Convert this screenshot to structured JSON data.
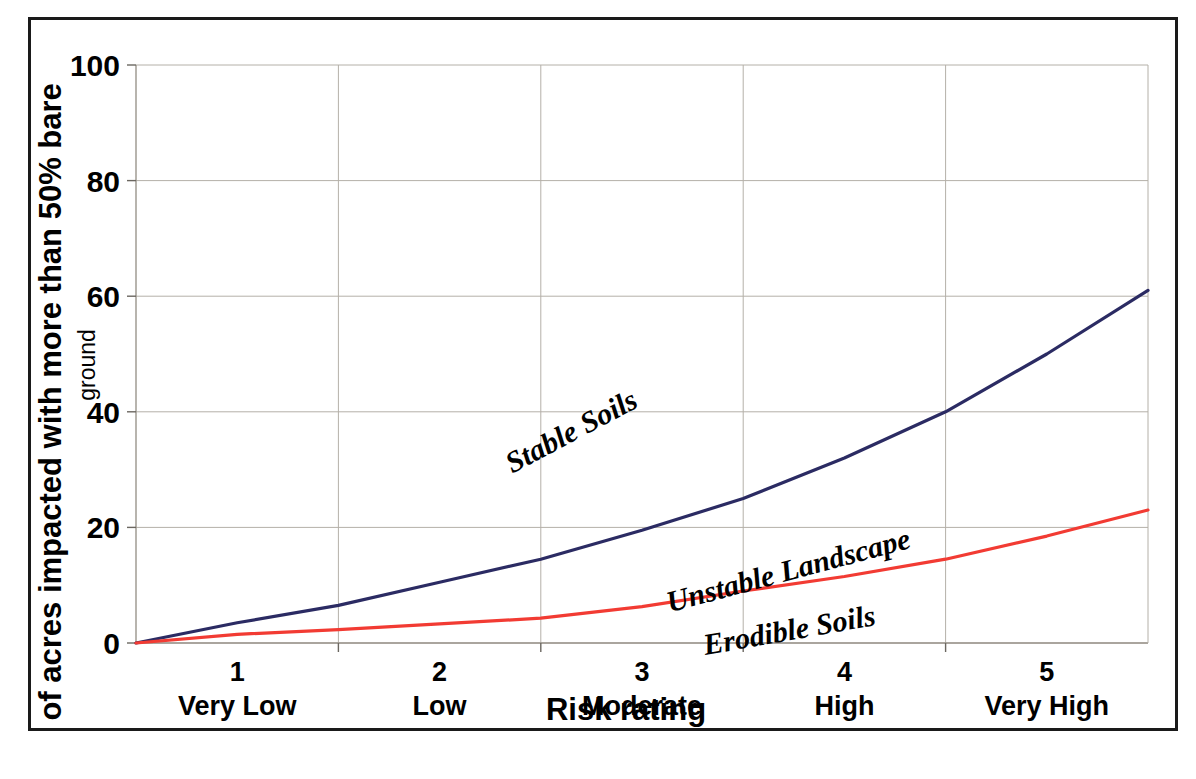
{
  "chart_data": {
    "type": "line",
    "title": "",
    "xlabel": "Risk rating",
    "ylabel": "% of acres impacted with more than 50% bare",
    "ylabel_line2": "ground",
    "ylim": [
      0,
      100
    ],
    "yticks": [
      0,
      20,
      40,
      60,
      80,
      100
    ],
    "ytick_labels": [
      "0",
      "20",
      "40",
      "60",
      "80",
      "100"
    ],
    "xlim": [
      0.5,
      5.5
    ],
    "grid": true,
    "legend_position": "inline-annotations",
    "categories": [
      {
        "num": "1",
        "name": "Very Low",
        "x": 1
      },
      {
        "num": "2",
        "name": "Low",
        "x": 2
      },
      {
        "num": "3",
        "name": "Moderate",
        "x": 3
      },
      {
        "num": "4",
        "name": "High",
        "x": 4
      },
      {
        "num": "5",
        "name": "Very High",
        "x": 5
      }
    ],
    "gridline_x_values": [
      1.5,
      2.5,
      3.5,
      4.5
    ],
    "series": [
      {
        "name": "Stable Soils",
        "color": "#2b2b63",
        "x": [
          0.5,
          1.0,
          1.5,
          2.0,
          2.5,
          3.0,
          3.5,
          4.0,
          4.5,
          5.0,
          5.5
        ],
        "values": [
          0,
          3.5,
          6.5,
          10.5,
          14.5,
          19.5,
          25,
          32,
          40,
          50,
          61
        ]
      },
      {
        "name": "Unstable Landscape",
        "color": "#f23b33",
        "x": [
          0.5,
          1.0,
          1.5,
          2.0,
          2.5,
          3.0,
          3.5,
          4.0,
          4.5,
          5.0,
          5.5
        ],
        "values": [
          0,
          1.5,
          2.3,
          3.3,
          4.3,
          6.3,
          9,
          11.5,
          14.5,
          18.5,
          23
        ]
      }
    ],
    "annotations": [
      {
        "label": "Stable Soils",
        "x_px": 545,
        "y_px": 420,
        "rotation": -28
      },
      {
        "label": "Unstable Landscape",
        "x_px": 760,
        "y_px": 560,
        "rotation": -15
      },
      {
        "label": "Erodible Soils",
        "x_px": 760,
        "y_px": 620,
        "rotation": -10
      }
    ]
  }
}
